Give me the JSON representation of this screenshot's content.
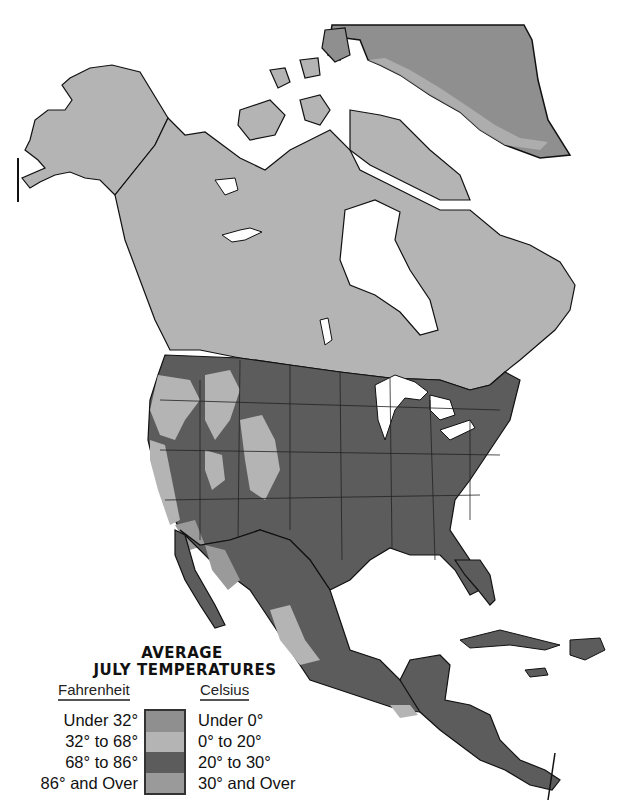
{
  "map": {
    "title_line1": "AVERAGE",
    "title_line2": "JULY TEMPERATURES",
    "region": "North America",
    "legend": {
      "fahrenheit_header": "Fahrenheit",
      "celsius_header": "Celsius",
      "entries": [
        {
          "fahrenheit": "Under 32°",
          "celsius": "Under 0°",
          "color": "#8f8f8f"
        },
        {
          "fahrenheit": "32° to 68°",
          "celsius": "0° to  20°",
          "color": "#b4b4b4"
        },
        {
          "fahrenheit": "68° to 86°",
          "celsius": "20° to 30°",
          "color": "#5c5c5c"
        },
        {
          "fahrenheit": "86° and Over",
          "celsius": "30° and Over",
          "color": "#9a9a9a"
        }
      ]
    },
    "colors": {
      "water": "#ffffff",
      "outline": "#111111",
      "under_32": "#8f8f8f",
      "f32_68": "#b4b4b4",
      "f68_86": "#5c5c5c",
      "over_86": "#9a9a9a"
    }
  }
}
